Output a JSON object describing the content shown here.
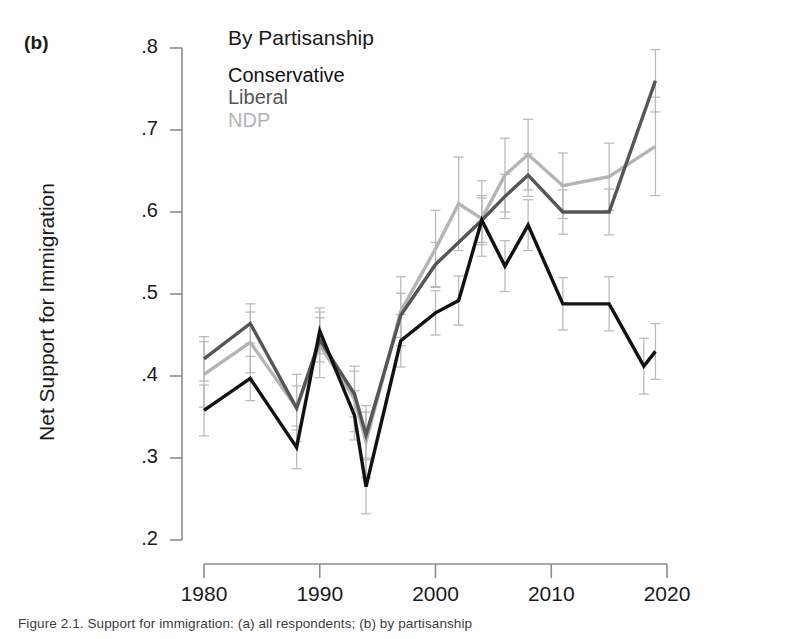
{
  "panel": {
    "label": "(b)"
  },
  "axes": {
    "ylabel": "Net Support for Immigration",
    "xlabel": "",
    "yticks": [
      ".2",
      ".3",
      ".4",
      ".5",
      ".6",
      ".7",
      ".8"
    ],
    "ytick_values": [
      0.2,
      0.3,
      0.4,
      0.5,
      0.6,
      0.7,
      0.8
    ],
    "xticks": [
      "1980",
      "1990",
      "2000",
      "2010",
      "2020"
    ],
    "xtick_values": [
      1980,
      1990,
      2000,
      2010,
      2020
    ]
  },
  "legend": {
    "title": "By Partisanship",
    "items": [
      {
        "label": "Conservative",
        "color": "#111111"
      },
      {
        "label": "Liberal",
        "color": "#555555"
      },
      {
        "label": "NDP",
        "color": "#b4b4b4"
      }
    ]
  },
  "caption": {
    "text": "Figure 2.1. Support for immigration: (a) all respondents; (b) by partisanship"
  },
  "chart_data": {
    "type": "line",
    "title": "By Partisanship",
    "xlabel": "",
    "ylabel": "Net Support for Immigration",
    "xlim": [
      1978.5,
      2021.5
    ],
    "ylim": [
      0.2,
      0.8
    ],
    "grid": false,
    "legend_position": "top-left-inside",
    "errorbars": true,
    "x": [
      1980,
      1984,
      1988,
      1990,
      1993,
      1994,
      1997,
      2000,
      2004,
      2006,
      2008,
      2011,
      2015,
      2019
    ],
    "series": [
      {
        "name": "Conservative",
        "color": "#111111",
        "values": [
          0.358,
          0.397,
          0.313,
          0.455,
          0.352,
          0.265,
          0.443,
          0.477,
          0.492,
          0.59,
          0.534,
          0.584,
          0.488,
          0.488,
          0.412,
          0.43
        ],
        "x_values": [
          1980,
          1984,
          1988,
          1990,
          1993,
          1994,
          1997,
          2000,
          2002,
          2004,
          2006,
          2008,
          2011,
          2015,
          2018,
          2019
        ],
        "err_low": [
          0.327,
          0.37,
          0.287,
          0.427,
          0.322,
          0.232,
          0.411,
          0.45,
          0.462,
          0.56,
          0.503,
          0.553,
          0.456,
          0.455,
          0.378,
          0.396
        ],
        "err_high": [
          0.389,
          0.424,
          0.339,
          0.483,
          0.382,
          0.298,
          0.475,
          0.504,
          0.522,
          0.62,
          0.565,
          0.615,
          0.52,
          0.521,
          0.446,
          0.464
        ]
      },
      {
        "name": "Liberal",
        "color": "#555555",
        "values": [
          0.421,
          0.464,
          0.361,
          0.444,
          0.378,
          0.328,
          0.474,
          0.536,
          0.59,
          0.619,
          0.645,
          0.6,
          0.6,
          0.76
        ],
        "x_values": [
          1980,
          1984,
          1988,
          1990,
          1993,
          1994,
          1997,
          2000,
          2004,
          2006,
          2008,
          2011,
          2015,
          2019
        ],
        "err_low": [
          0.394,
          0.44,
          0.334,
          0.417,
          0.35,
          0.3,
          0.447,
          0.509,
          0.563,
          0.592,
          0.619,
          0.573,
          0.572,
          0.722
        ],
        "err_high": [
          0.448,
          0.488,
          0.388,
          0.471,
          0.406,
          0.356,
          0.501,
          0.563,
          0.617,
          0.646,
          0.671,
          0.627,
          0.628,
          0.798
        ]
      },
      {
        "name": "NDP",
        "color": "#b4b4b4",
        "values": [
          0.402,
          0.441,
          0.361,
          0.438,
          0.372,
          0.32,
          0.479,
          0.555,
          0.61,
          0.592,
          0.645,
          0.67,
          0.632,
          0.643,
          0.68
        ],
        "x_values": [
          1980,
          1984,
          1988,
          1990,
          1993,
          1994,
          1997,
          2000,
          2002,
          2004,
          2006,
          2008,
          2011,
          2015,
          2019
        ],
        "err_low": [
          0.362,
          0.404,
          0.32,
          0.398,
          0.332,
          0.276,
          0.437,
          0.508,
          0.553,
          0.546,
          0.6,
          0.627,
          0.592,
          0.602,
          0.62
        ],
        "err_high": [
          0.442,
          0.478,
          0.402,
          0.478,
          0.412,
          0.364,
          0.521,
          0.602,
          0.667,
          0.638,
          0.69,
          0.713,
          0.672,
          0.684,
          0.74
        ]
      }
    ]
  }
}
